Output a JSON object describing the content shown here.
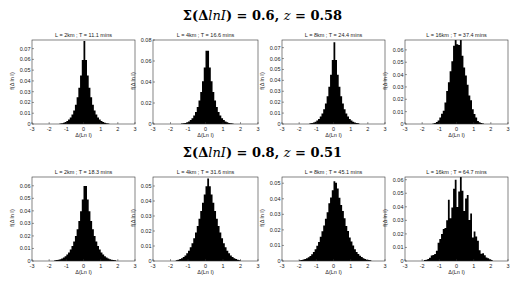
{
  "rows": [
    {
      "title_sigma": "Σ(Δ",
      "title_var": "lnI",
      "title_rest": ") = 0.6, ",
      "title_z": "z",
      "title_zval": " = 0.58"
    },
    {
      "title_sigma": "Σ(Δ",
      "title_var": "lnI",
      "title_rest": ") = 0.8, ",
      "title_z": "z",
      "title_zval": " = 0.51"
    }
  ],
  "axis": {
    "xlabel": "Δ(Ln I)",
    "ylabel": "f(Δ ln I)",
    "xticks": [
      "-3",
      "-2",
      "-1",
      "0",
      "1",
      "2",
      "3"
    ]
  },
  "chart_data": [
    {
      "type": "bar",
      "title": "L = 2km ; T = 11.1 mins",
      "row": 0,
      "xlabel": "Δ(Ln I)",
      "ylabel": "f(Δ ln I)",
      "xlim": [
        -3,
        3
      ],
      "ylim": [
        0,
        0.078
      ],
      "yticks": [
        0,
        0.01,
        0.02,
        0.03,
        0.04,
        0.05,
        0.06,
        0.07
      ],
      "shape": "laplace",
      "peak": 0.077,
      "center": 0.05,
      "scale": 0.42,
      "noise": 0
    },
    {
      "type": "bar",
      "title": "L = 4km ; T = 16.6 mins",
      "row": 0,
      "xlabel": "Δ(Ln I)",
      "ylabel": "f(Δ ln I)",
      "xlim": [
        -3,
        3
      ],
      "ylim": [
        0,
        0.08
      ],
      "yticks": [
        0,
        0.02,
        0.04,
        0.06,
        0.08
      ],
      "shape": "laplace",
      "peak": 0.079,
      "center": 0.1,
      "scale": 0.43,
      "noise": 0
    },
    {
      "type": "bar",
      "title": "L = 8km ; T = 24.4 mins",
      "row": 0,
      "xlabel": "Δ(Ln I)",
      "ylabel": "f(Δ ln I)",
      "xlim": [
        -3,
        3
      ],
      "ylim": [
        0,
        0.077
      ],
      "yticks": [
        0,
        0.01,
        0.02,
        0.03,
        0.04,
        0.05,
        0.06,
        0.07
      ],
      "shape": "laplace",
      "peak": 0.075,
      "center": 0.05,
      "scale": 0.44,
      "noise": 0
    },
    {
      "type": "bar",
      "title": "L = 16km ; T = 37.4 mins",
      "row": 0,
      "xlabel": "Δ(Ln I)",
      "ylabel": "f(Δ ln I)",
      "xlim": [
        -3,
        3
      ],
      "ylim": [
        0,
        0.068
      ],
      "yticks": [
        0,
        0.01,
        0.02,
        0.03,
        0.04,
        0.05,
        0.06
      ],
      "shape": "gauss",
      "peak": 0.067,
      "center": 0.1,
      "scale": 0.5,
      "noise": 0.12,
      "seed": 7
    },
    {
      "type": "bar",
      "title": "L = 2km ; T = 18.3 mins",
      "row": 1,
      "xlabel": "Δ(Ln I)",
      "ylabel": "f(Δ ln I)",
      "xlim": [
        -3,
        3
      ],
      "ylim": [
        0,
        0.067
      ],
      "yticks": [
        0,
        0.01,
        0.02,
        0.03,
        0.04,
        0.05,
        0.06
      ],
      "shape": "laplace",
      "peak": 0.066,
      "center": 0.1,
      "scale": 0.55,
      "noise": 0
    },
    {
      "type": "bar",
      "title": "L = 4km ; T = 31.6 mins",
      "row": 1,
      "xlabel": "Δ(Ln I)",
      "ylabel": "f(Δ ln I)",
      "xlim": [
        -3,
        3
      ],
      "ylim": [
        0,
        0.056
      ],
      "yticks": [
        0,
        0.01,
        0.02,
        0.03,
        0.04,
        0.05
      ],
      "shape": "mixed",
      "peak": 0.055,
      "center": 0.15,
      "scale": 0.62,
      "noise": 0
    },
    {
      "type": "bar",
      "title": "L = 8km ; T = 45.1 mins",
      "row": 1,
      "xlabel": "Δ(Ln I)",
      "ylabel": "f(Δ ln I)",
      "xlim": [
        -3,
        3
      ],
      "ylim": [
        0,
        0.054
      ],
      "yticks": [
        0,
        0.01,
        0.02,
        0.03,
        0.04,
        0.05
      ],
      "shape": "mixed",
      "peak": 0.053,
      "center": 0.1,
      "scale": 0.68,
      "noise": 0.02,
      "seed": 3
    },
    {
      "type": "bar",
      "title": "L = 16km ; T = 64.7 mins",
      "row": 1,
      "xlabel": "Δ(Ln I)",
      "ylabel": "f(Δ ln I)",
      "xlim": [
        -3,
        3
      ],
      "ylim": [
        0,
        0.062
      ],
      "yticks": [
        0,
        0.01,
        0.02,
        0.03,
        0.04,
        0.05,
        0.06
      ],
      "shape": "gauss",
      "peak": 0.055,
      "center": 0.1,
      "scale": 0.72,
      "noise": 0.28,
      "seed": 11
    }
  ],
  "layout": {
    "cols": [
      [
        32,
        135
      ],
      [
        153,
        258
      ],
      [
        282,
        385
      ],
      [
        405,
        508
      ]
    ],
    "rows": [
      [
        40,
        124
      ],
      [
        177,
        261
      ]
    ],
    "title_y": [
      8,
      145
    ]
  }
}
